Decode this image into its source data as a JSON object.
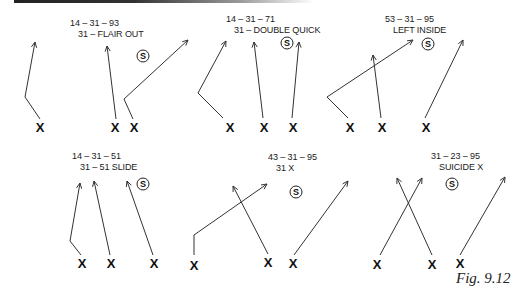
{
  "figure": {
    "caption": "Fig. 9.12",
    "line_color": "#333333"
  },
  "plays": [
    {
      "id": "flair-out",
      "code": "14 – 31 – 93",
      "name": "31 – FLAIR OUT",
      "label_pos": [
        70,
        18
      ],
      "safety": {
        "symbol": "S",
        "pos": [
          143,
          56
        ]
      },
      "players": [
        {
          "symbol": "X",
          "pos": [
            40,
            127
          ]
        },
        {
          "symbol": "X",
          "pos": [
            115,
            127
          ]
        },
        {
          "symbol": "X",
          "pos": [
            134,
            127
          ]
        }
      ],
      "routes": [
        [
          [
            40,
            119
          ],
          [
            25,
            97
          ],
          [
            35,
            42
          ]
        ],
        [
          [
            116,
            119
          ],
          [
            107,
            46
          ]
        ],
        [
          [
            133,
            119
          ],
          [
            124,
            99
          ],
          [
            188,
            40
          ]
        ]
      ]
    },
    {
      "id": "double-quick",
      "code": "14 – 31 – 71",
      "name": "31 – DOUBLE QUICK",
      "label_pos": [
        226,
        14
      ],
      "safety": {
        "symbol": "S",
        "pos": [
          287,
          43
        ]
      },
      "players": [
        {
          "symbol": "X",
          "pos": [
            230,
            127
          ]
        },
        {
          "symbol": "X",
          "pos": [
            264,
            127
          ]
        },
        {
          "symbol": "X",
          "pos": [
            293,
            127
          ]
        }
      ],
      "routes": [
        [
          [
            223,
            118
          ],
          [
            198,
            93
          ],
          [
            226,
            41
          ]
        ],
        [
          [
            263,
            118
          ],
          [
            254,
            42
          ]
        ],
        [
          [
            292,
            118
          ],
          [
            299,
            42
          ]
        ]
      ]
    },
    {
      "id": "left-inside",
      "code": "53 – 31 – 95",
      "name": "LEFT INSIDE",
      "label_pos": [
        385,
        14
      ],
      "safety": {
        "symbol": "S",
        "pos": [
          428,
          44
        ]
      },
      "players": [
        {
          "symbol": "X",
          "pos": [
            350,
            127
          ]
        },
        {
          "symbol": "X",
          "pos": [
            382,
            127
          ]
        },
        {
          "symbol": "X",
          "pos": [
            426,
            127
          ]
        }
      ],
      "routes": [
        [
          [
            348,
            118
          ],
          [
            327,
            97
          ],
          [
            413,
            40
          ]
        ],
        [
          [
            381,
            118
          ],
          [
            373,
            55
          ]
        ],
        [
          [
            425,
            118
          ],
          [
            463,
            40
          ]
        ]
      ]
    },
    {
      "id": "slide",
      "code": "14 – 31 – 51",
      "name": "31 – 51 SLIDE",
      "label_pos": [
        72,
        151
      ],
      "safety": {
        "symbol": "S",
        "pos": [
          143,
          184
        ]
      },
      "players": [
        {
          "symbol": "X",
          "pos": [
            82,
            263
          ]
        },
        {
          "symbol": "X",
          "pos": [
            111,
            263
          ]
        },
        {
          "symbol": "X",
          "pos": [
            154,
            263
          ]
        }
      ],
      "routes": [
        [
          [
            81,
            255
          ],
          [
            70,
            241
          ],
          [
            80,
            183
          ]
        ],
        [
          [
            110,
            255
          ],
          [
            94,
            181
          ]
        ],
        [
          [
            153,
            255
          ],
          [
            127,
            181
          ]
        ]
      ]
    },
    {
      "id": "31-x",
      "code": "43 – 31 – 95",
      "name": "31  X",
      "label_pos": [
        268,
        152
      ],
      "safety": {
        "symbol": "S",
        "pos": [
          296,
          192
        ]
      },
      "players": [
        {
          "symbol": "X",
          "pos": [
            194,
            265
          ]
        },
        {
          "symbol": "X",
          "pos": [
            268,
            262
          ]
        },
        {
          "symbol": "X",
          "pos": [
            293,
            263
          ]
        }
      ],
      "routes": [
        [
          [
            194,
            255
          ],
          [
            194,
            235
          ],
          [
            267,
            184
          ]
        ],
        [
          [
            268,
            254
          ],
          [
            233,
            186
          ]
        ],
        [
          [
            294,
            255
          ],
          [
            348,
            181
          ]
        ]
      ]
    },
    {
      "id": "suicide-x",
      "code": "31 – 23 – 95",
      "name": "SUICIDE X",
      "label_pos": [
        431,
        151
      ],
      "safety": {
        "symbol": "S",
        "pos": [
          452,
          184
        ]
      },
      "players": [
        {
          "symbol": "X",
          "pos": [
            377,
            264
          ]
        },
        {
          "symbol": "X",
          "pos": [
            432,
            264
          ]
        },
        {
          "symbol": "X",
          "pos": [
            460,
            263
          ]
        }
      ],
      "routes": [
        [
          [
            380,
            255
          ],
          [
            422,
            178
          ]
        ],
        [
          [
            432,
            255
          ],
          [
            397,
            178
          ]
        ],
        [
          [
            460,
            255
          ],
          [
            505,
            177
          ]
        ]
      ]
    }
  ]
}
